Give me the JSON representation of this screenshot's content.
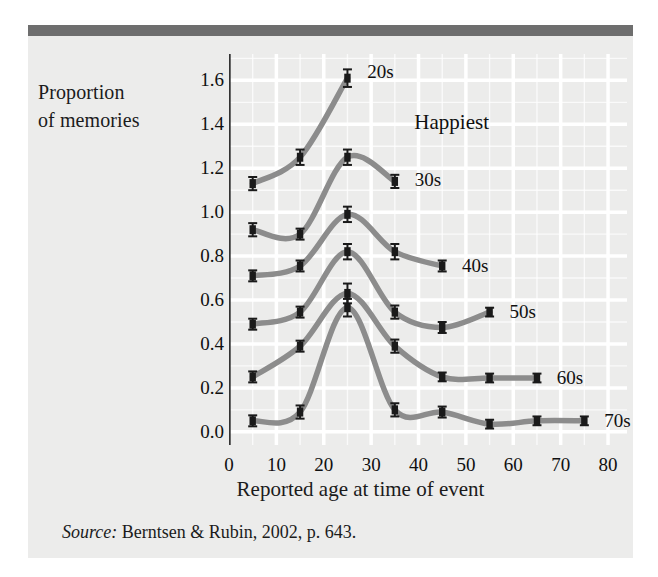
{
  "figure": {
    "y_axis_title_line1": "Proportion",
    "y_axis_title_line2": "of memories",
    "source_word": "Source:",
    "source_text": " Berntsen & Rubin, 2002, p. 643."
  },
  "colors": {
    "panel_background": "#ececeb",
    "header_bar": "#6e6e6e",
    "gridline": "#ffffff",
    "line": "#8c8c8c",
    "marker": "#1a1a1a",
    "axis": "#333333",
    "text": "#101010"
  },
  "chart_data": {
    "type": "line",
    "title": "",
    "xlabel": "Reported age at time of event",
    "ylabel": "Proportion of memories",
    "xlim": [
      0,
      84
    ],
    "ylim": [
      -0.06,
      1.72
    ],
    "xticks": [
      0,
      10,
      20,
      30,
      40,
      50,
      60,
      70,
      80
    ],
    "xticklabels": [
      "0",
      "10",
      "20",
      "30",
      "40",
      "50",
      "60",
      "70",
      "80"
    ],
    "yticks": [
      0.0,
      0.2,
      0.4,
      0.6,
      0.8,
      1.0,
      1.2,
      1.4,
      1.6
    ],
    "yticklabels": [
      "0.0",
      "0.2",
      "0.4",
      "0.6",
      "0.8",
      "1.0",
      "1.2",
      "1.4",
      "1.6"
    ],
    "grid": true,
    "grid_style": "white lines on gray panel, both axes",
    "legend": "inline labels at end of each series",
    "annotations": [
      {
        "text": "Happiest",
        "x": 47,
        "y": 1.41
      }
    ],
    "error_bars": true,
    "series": [
      {
        "name": "20s",
        "label": "20s",
        "label_x": 27.5,
        "label_y": 1.64,
        "x": [
          5,
          15,
          25
        ],
        "y": [
          1.13,
          1.25,
          1.61
        ],
        "yerr": [
          0.03,
          0.035,
          0.04
        ]
      },
      {
        "name": "30s",
        "label": "30s",
        "label_x": 37.5,
        "label_y": 1.145,
        "x": [
          5,
          15,
          25,
          35
        ],
        "y": [
          0.92,
          0.9,
          1.25,
          1.14
        ],
        "yerr": [
          0.03,
          0.025,
          0.035,
          0.03
        ]
      },
      {
        "name": "40s",
        "label": "40s",
        "label_x": 47.5,
        "label_y": 0.755,
        "x": [
          5,
          15,
          25,
          35,
          45
        ],
        "y": [
          0.71,
          0.755,
          0.99,
          0.82,
          0.755
        ],
        "yerr": [
          0.025,
          0.025,
          0.035,
          0.035,
          0.025
        ]
      },
      {
        "name": "50s",
        "label": "50s",
        "label_x": 57.5,
        "label_y": 0.545,
        "x": [
          5,
          15,
          25,
          35,
          45,
          55
        ],
        "y": [
          0.49,
          0.545,
          0.82,
          0.545,
          0.475,
          0.545
        ],
        "yerr": [
          0.025,
          0.025,
          0.035,
          0.03,
          0.025,
          0.02
        ]
      },
      {
        "name": "60s",
        "label": "60s",
        "label_x": 67.5,
        "label_y": 0.245,
        "x": [
          5,
          15,
          25,
          35,
          45,
          55,
          65
        ],
        "y": [
          0.25,
          0.39,
          0.63,
          0.39,
          0.25,
          0.245,
          0.245
        ],
        "yerr": [
          0.025,
          0.025,
          0.045,
          0.03,
          0.02,
          0.02,
          0.02
        ]
      },
      {
        "name": "70s",
        "label": "70s",
        "label_x": 77.5,
        "label_y": 0.05,
        "x": [
          5,
          15,
          25,
          35,
          45,
          55,
          65,
          75
        ],
        "y": [
          0.05,
          0.09,
          0.565,
          0.1,
          0.09,
          0.035,
          0.05,
          0.05
        ],
        "yerr": [
          0.025,
          0.03,
          0.04,
          0.03,
          0.025,
          0.02,
          0.02,
          0.02
        ]
      }
    ]
  }
}
